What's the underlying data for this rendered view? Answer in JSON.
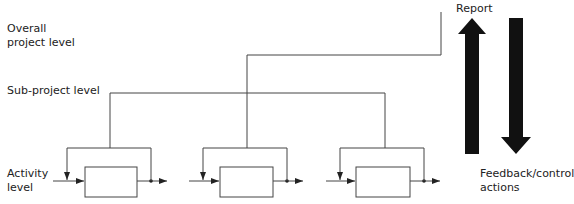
{
  "labels": {
    "overall_line1": "Overall",
    "overall_line2": "project level",
    "subproject": "Sub-project level",
    "activity_line1": "Activity",
    "activity_line2": "level",
    "report": "Report",
    "feedback_line1": "Feedback/control",
    "feedback_line2": "actions"
  },
  "colors": {
    "line": "#444444",
    "arrow_fill": "#111111",
    "text": "#222222"
  },
  "activities": [
    {
      "id": 1,
      "box_x": 85
    },
    {
      "id": 2,
      "box_x": 220
    },
    {
      "id": 3,
      "box_x": 356
    }
  ]
}
